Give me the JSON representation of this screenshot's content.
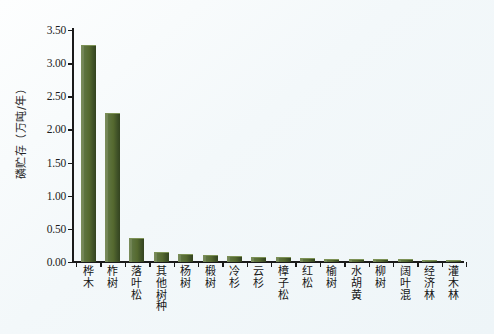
{
  "chart_data": {
    "type": "bar",
    "title": "",
    "xlabel": "",
    "ylabel": "磷贮存（万吨/年）",
    "ylim": [
      0.0,
      3.5
    ],
    "ytick_labels": [
      "3.50",
      "3.00",
      "2.50",
      "2.00",
      "1.50",
      "1.00",
      "0.50",
      "0.00"
    ],
    "ytick_values": [
      3.5,
      3.0,
      2.5,
      2.0,
      1.5,
      1.0,
      0.5,
      0.0
    ],
    "grid": false,
    "legend": "none",
    "bar_color": "#55692f",
    "bar_edge_color": "#33431f",
    "axis_color": "#1a1a1a",
    "background_color": "#f1f7fa",
    "categories": [
      "桦木",
      "柞树",
      "落叶松",
      "其他树种",
      "杨树",
      "椴树",
      "冷杉",
      "云杉",
      "樟子松",
      "红松",
      "榆树",
      "水胡黄",
      "柳树",
      "阔叶混",
      "经济林",
      "灌木林"
    ],
    "values": [
      3.27,
      2.25,
      0.36,
      0.15,
      0.12,
      0.11,
      0.09,
      0.08,
      0.07,
      0.06,
      0.05,
      0.05,
      0.04,
      0.04,
      0.03,
      0.03
    ]
  }
}
